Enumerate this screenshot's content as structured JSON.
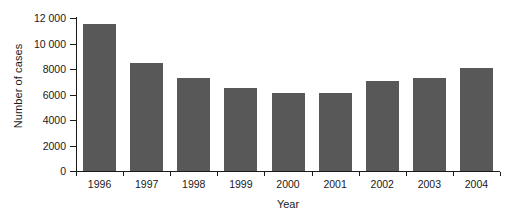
{
  "chart_data": {
    "type": "bar",
    "title": "",
    "xlabel": "Year",
    "ylabel": "Number of cases",
    "categories": [
      "1996",
      "1997",
      "1998",
      "1999",
      "2000",
      "2001",
      "2002",
      "2003",
      "2004"
    ],
    "values": [
      11500,
      8500,
      7300,
      6500,
      6100,
      6150,
      7050,
      7300,
      8050
    ],
    "ylim": [
      0,
      12000
    ],
    "ytick_values": [
      0,
      2000,
      4000,
      6000,
      8000,
      10000,
      12000
    ],
    "ytick_labels": [
      "0",
      "2000",
      "4000",
      "6000",
      "8000",
      "10 000",
      "12 000"
    ],
    "grid": false,
    "legend": "none",
    "bar_color": "#585858",
    "background_color": "#ffffff",
    "axis_color": "#1a1a1a"
  }
}
